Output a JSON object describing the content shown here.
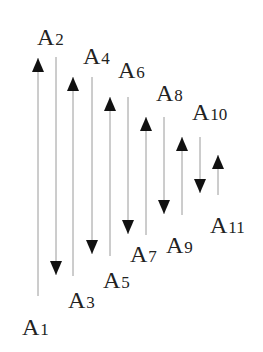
{
  "diagram": {
    "type": "alternating vertical arrows",
    "line_color": "#9a9a9a",
    "arrow_color": "#111111",
    "labels": [
      {
        "id": "A1",
        "letter": "A",
        "sub": "1",
        "x": 22,
        "y": 335
      },
      {
        "id": "A2",
        "letter": "A",
        "sub": "2",
        "x": 37,
        "y": 45
      },
      {
        "id": "A3",
        "letter": "A",
        "sub": "3",
        "x": 68,
        "y": 308
      },
      {
        "id": "A4",
        "letter": "A",
        "sub": "4",
        "x": 83,
        "y": 64
      },
      {
        "id": "A5",
        "letter": "A",
        "sub": "5",
        "x": 103,
        "y": 288
      },
      {
        "id": "A6",
        "letter": "A",
        "sub": "6",
        "x": 118,
        "y": 78
      },
      {
        "id": "A7",
        "letter": "A",
        "sub": "7",
        "x": 130,
        "y": 262
      },
      {
        "id": "A8",
        "letter": "A",
        "sub": "8",
        "x": 156,
        "y": 101
      },
      {
        "id": "A9",
        "letter": "A",
        "sub": "9",
        "x": 166,
        "y": 253
      },
      {
        "id": "A10",
        "letter": "A",
        "sub": "10",
        "x": 192,
        "y": 120
      },
      {
        "id": "A11",
        "letter": "A",
        "sub": "11",
        "x": 210,
        "y": 233
      }
    ],
    "arrows": [
      {
        "x": 38,
        "top": 58,
        "bottom": 296,
        "dir": "up"
      },
      {
        "x": 56,
        "top": 57,
        "bottom": 275,
        "dir": "down"
      },
      {
        "x": 73,
        "top": 77,
        "bottom": 276,
        "dir": "up"
      },
      {
        "x": 92,
        "top": 77,
        "bottom": 254,
        "dir": "down"
      },
      {
        "x": 110,
        "top": 97,
        "bottom": 256,
        "dir": "up"
      },
      {
        "x": 128,
        "top": 97,
        "bottom": 234,
        "dir": "down"
      },
      {
        "x": 146,
        "top": 117,
        "bottom": 235,
        "dir": "up"
      },
      {
        "x": 164,
        "top": 117,
        "bottom": 214,
        "dir": "down"
      },
      {
        "x": 182,
        "top": 137,
        "bottom": 215,
        "dir": "up"
      },
      {
        "x": 200,
        "top": 137,
        "bottom": 193,
        "dir": "down"
      },
      {
        "x": 218,
        "top": 155,
        "bottom": 195,
        "dir": "up"
      }
    ]
  }
}
